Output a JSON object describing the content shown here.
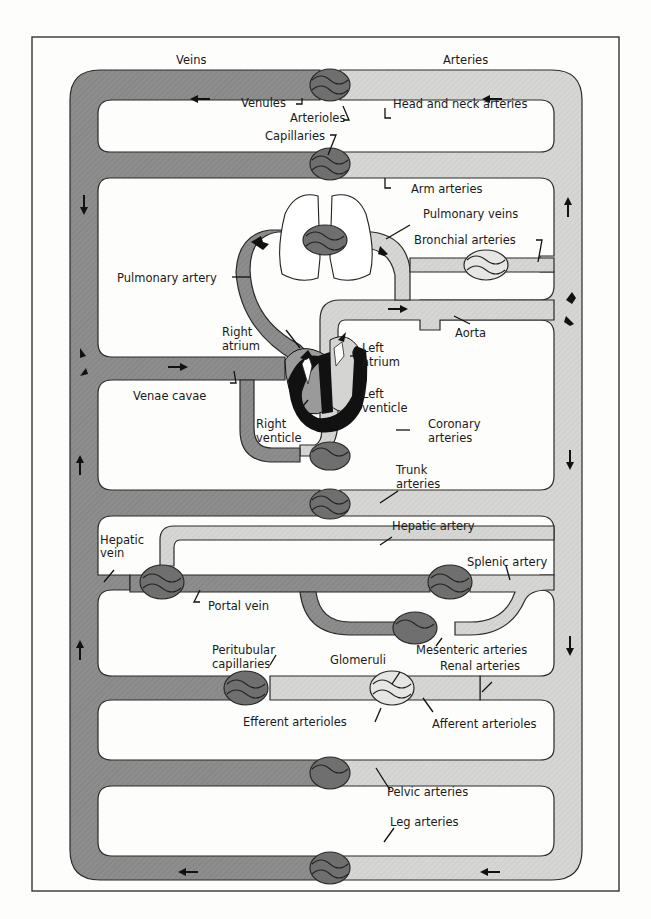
{
  "diagram": {
    "title_left": "Veins",
    "title_right": "Arteries",
    "colors": {
      "venous": "#8d8d8d",
      "arterial": "#d4d4d2",
      "capillary_bed": "#6f6f6f",
      "heart_wall": "#111111",
      "outline": "#2a2a2a"
    },
    "labels": {
      "venules": "Venules",
      "arterioles": "Arterioles",
      "head_neck_arteries": "Head and neck  arteries",
      "capillaries": "Capillaries",
      "arm_arteries": "Arm arteries",
      "pulmonary_veins": "Pulmonary veins",
      "bronchial_arteries": "Bronchial arteries",
      "pulmonary_artery": "Pulmonary artery",
      "aorta": "Aorta",
      "right_atrium_1": "Right",
      "right_atrium_2": "atrium",
      "left_atrium_1": "Left",
      "left_atrium_2": "atrium",
      "venae_cavae": "Venae cavae",
      "left_ventricle_1": "Left",
      "left_ventricle_2": "venticle",
      "right_ventricle_1": "Right",
      "right_ventricle_2": "venticle",
      "coronary_arteries_1": "Coronary",
      "coronary_arteries_2": "arteries",
      "trunk_arteries_1": "Trunk",
      "trunk_arteries_2": "arteries",
      "hepatic_artery": "Hepatic artery",
      "hepatic_vein_1": "Hepatic",
      "hepatic_vein_2": "vein",
      "splenic_artery": "Splenic artery",
      "portal_vein": "Portal vein",
      "mesenteric_arteries": "Mesenteric arteries",
      "peritubular_capillaries_1": "Peritubular",
      "peritubular_capillaries_2": "capillaries",
      "glomeruli": "Glomeruli",
      "renal_arteries": "Renal arteries",
      "efferent_arterioles": "Efferent arterioles",
      "afferent_arterioles": "Afferent arterioles",
      "pelvic_arteries": "Pelvic arteries",
      "leg_arteries": "Leg arteries"
    }
  }
}
